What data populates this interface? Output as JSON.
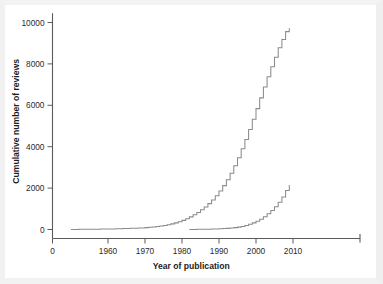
{
  "figure": {
    "kind": "scientific-line-chart",
    "background_color": "#ffffff",
    "line_color": "#8b8b8b",
    "axis_color": "#5a5a5a",
    "text_color": "#2b2b2b"
  },
  "chart_data": {
    "type": "line",
    "title": "",
    "subtitle": "",
    "xlabel": "Year of publication",
    "ylabel": "Cumulative number of reviews",
    "xlim": [
      0,
      2030
    ],
    "ylim": [
      0,
      10400
    ],
    "x_ticks": [
      0,
      1960,
      1970,
      1980,
      1990,
      2000,
      2010
    ],
    "x_tick_labels": [
      "0",
      "1960",
      "1970",
      "1980",
      "1990",
      "2000",
      "2010"
    ],
    "y_ticks": [
      0,
      2000,
      4000,
      6000,
      8000,
      10000
    ],
    "y_tick_labels": [
      "0",
      "2000",
      "4000",
      "6000",
      "8000",
      "10000"
    ],
    "grid": false,
    "legend": false,
    "legend_position": "none",
    "axis_style": "stepped-cumulative",
    "series": [
      {
        "name": "All reviews (cumulative)",
        "style": "step",
        "x": [
          1950,
          1952,
          1954,
          1956,
          1958,
          1960,
          1962,
          1964,
          1966,
          1968,
          1970,
          1971,
          1972,
          1973,
          1974,
          1975,
          1976,
          1977,
          1978,
          1979,
          1980,
          1981,
          1982,
          1983,
          1984,
          1985,
          1986,
          1987,
          1988,
          1989,
          1990,
          1991,
          1992,
          1993,
          1994,
          1995,
          1996,
          1997,
          1998,
          1999,
          2000,
          2001,
          2002,
          2003,
          2004,
          2005,
          2006,
          2007,
          2008,
          2009
        ],
        "values": [
          5,
          8,
          12,
          16,
          22,
          28,
          36,
          46,
          58,
          72,
          90,
          105,
          122,
          142,
          165,
          195,
          230,
          272,
          320,
          375,
          440,
          520,
          610,
          710,
          820,
          950,
          1090,
          1250,
          1430,
          1630,
          1860,
          2120,
          2400,
          2720,
          3080,
          3470,
          3900,
          4350,
          4830,
          5330,
          5840,
          6360,
          6880,
          7380,
          7860,
          8320,
          8780,
          9180,
          9560,
          9720
        ]
      },
      {
        "name": "Subset of reviews (cumulative)",
        "style": "step",
        "x": [
          1982,
          1984,
          1986,
          1988,
          1990,
          1991,
          1992,
          1993,
          1994,
          1995,
          1996,
          1997,
          1998,
          1999,
          2000,
          2001,
          2002,
          2003,
          2004,
          2005,
          2006,
          2007,
          2008,
          2009
        ],
        "values": [
          5,
          10,
          16,
          24,
          35,
          44,
          55,
          70,
          90,
          115,
          150,
          195,
          250,
          320,
          400,
          500,
          620,
          760,
          920,
          1100,
          1320,
          1570,
          1880,
          2150
        ]
      }
    ]
  },
  "axis_labels": {
    "x_title": "Year of publication",
    "y_title": "Cumulative number of reviews"
  }
}
